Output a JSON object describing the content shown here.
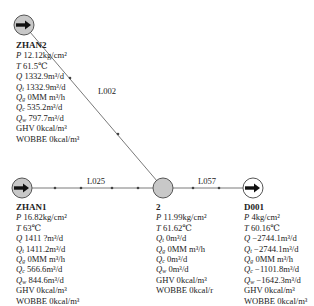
{
  "colors": {
    "line": "#7a7a7a",
    "node_gray": "#c8c8c8",
    "node_white": "#ffffff",
    "arrow": "#111111"
  },
  "pipes": [
    {
      "id": "L002",
      "label": "L002"
    },
    {
      "id": "L025",
      "label": "L025"
    },
    {
      "id": "L057",
      "label": "L057"
    }
  ],
  "nodes": {
    "zhan2": {
      "name": "ZHAN2",
      "icon": "source-arrow-icon",
      "rows": [
        {
          "sym": "P",
          "sub": "",
          "val": "12.12kg/cm²"
        },
        {
          "sym": "T",
          "sub": "",
          "val": "61.5℃"
        },
        {
          "sym": "Q",
          "sub": "",
          "val": "1332.9m³/d"
        },
        {
          "sym": "Q",
          "sub": "t",
          "val": "1332.9m³/d"
        },
        {
          "sym": "Q",
          "sub": "g",
          "val": "0MM m³/h"
        },
        {
          "sym": "Q",
          "sub": "c",
          "val": "535.2m³/d"
        },
        {
          "sym": "Q",
          "sub": "w",
          "val": "797.7m³/d"
        },
        {
          "sym": "",
          "sub": "",
          "val": "GHV 0kcal/m³"
        },
        {
          "sym": "",
          "sub": "",
          "val": "WOBBE 0kcal/m³"
        }
      ]
    },
    "zhan1": {
      "name": "ZHAN1",
      "icon": "source-arrow-icon",
      "rows": [
        {
          "sym": "P",
          "sub": "",
          "val": "16.82kg/cm²"
        },
        {
          "sym": "T",
          "sub": "",
          "val": "63℃"
        },
        {
          "sym": "Q",
          "sub": "",
          "val": "1411 ?m³/d"
        },
        {
          "sym": "Q",
          "sub": "t",
          "val": "1411.2m³/d"
        },
        {
          "sym": "Q",
          "sub": "g",
          "val": "0MM m³/h"
        },
        {
          "sym": "Q",
          "sub": "c",
          "val": "566.6m³/d"
        },
        {
          "sym": "Q",
          "sub": "w",
          "val": "844.6m³/d"
        },
        {
          "sym": "",
          "sub": "",
          "val": "GHV 0kcal/m³"
        },
        {
          "sym": "",
          "sub": "",
          "val": "WOBBE 0kcal/m³"
        }
      ]
    },
    "n2": {
      "name": "2",
      "icon": "junction-node-icon",
      "rows": [
        {
          "sym": "P",
          "sub": "",
          "val": "11.99kg/cm²"
        },
        {
          "sym": "T",
          "sub": "",
          "val": "61.62℃"
        },
        {
          "sym": "Q",
          "sub": "t",
          "val": "0m³/d"
        },
        {
          "sym": "Q",
          "sub": "g",
          "val": "0MM m³/h"
        },
        {
          "sym": "Q",
          "sub": "c",
          "val": "0m³/d"
        },
        {
          "sym": "Q",
          "sub": "w",
          "val": "0m³/d"
        },
        {
          "sym": "",
          "sub": "",
          "val": "GHV 0kcal/m³"
        },
        {
          "sym": "",
          "sub": "",
          "val": "WOBBE 0kcal/r"
        }
      ]
    },
    "d001": {
      "name": "D001",
      "icon": "sink-arrow-icon",
      "rows": [
        {
          "sym": "P",
          "sub": "",
          "val": "4kg/cm²"
        },
        {
          "sym": "T",
          "sub": "",
          "val": "60.16℃"
        },
        {
          "sym": "Q",
          "sub": "",
          "val": "−2744.1m³/d"
        },
        {
          "sym": "Q",
          "sub": "t",
          "val": "−2744.1m³/d"
        },
        {
          "sym": "Q",
          "sub": "g",
          "val": "0MM m³/h"
        },
        {
          "sym": "Q",
          "sub": "c",
          "val": "−1101.8m³/d"
        },
        {
          "sym": "Q",
          "sub": "w",
          "val": "−1642.3m³/d"
        },
        {
          "sym": "",
          "sub": "",
          "val": "GHV 0kcal/m³"
        },
        {
          "sym": "",
          "sub": "",
          "val": "WOBBE 0kcal/m³"
        }
      ]
    }
  }
}
